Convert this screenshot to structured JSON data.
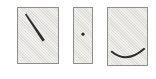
{
  "scene": {
    "description": "Three stippled gray panels with abstract marks",
    "background": "#ffffff"
  },
  "colors": {
    "panel_fill": "#e9e8e4",
    "panel_border": "#8d8d8d",
    "mark": "#2d2d2d"
  },
  "panels": [
    {
      "name": "panel-diagonal-line",
      "mark": "diagonal-line-icon"
    },
    {
      "name": "panel-dot",
      "mark": "dot-icon"
    },
    {
      "name": "panel-arc",
      "mark": "arc-icon"
    }
  ]
}
